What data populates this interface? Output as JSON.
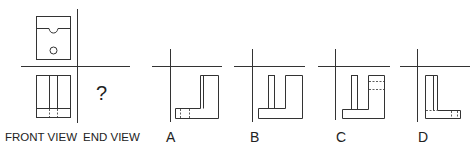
{
  "problem": {
    "question_mark": "?",
    "labels": {
      "front_view": "FRONT VIEW",
      "end_view": "END VIEW"
    }
  },
  "options": [
    {
      "id": "A",
      "label": "A"
    },
    {
      "id": "B",
      "label": "B"
    },
    {
      "id": "C",
      "label": "C"
    },
    {
      "id": "D",
      "label": "D"
    }
  ],
  "colors": {
    "line": "#333333",
    "background": "#ffffff"
  }
}
